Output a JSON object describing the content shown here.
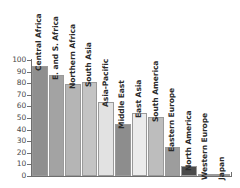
{
  "chart_data": {
    "type": "bar",
    "title": "",
    "subtitle": "",
    "xlabel": "",
    "ylabel": "",
    "ylim": [
      0,
      100
    ],
    "yticks": [
      0,
      10,
      20,
      30,
      40,
      50,
      60,
      70,
      80,
      90,
      100
    ],
    "ytick_labels": [
      "0",
      "10",
      "20",
      "30",
      "40",
      "50",
      "60",
      "70",
      "80",
      "90",
      "100"
    ],
    "grid": false,
    "legend": "none",
    "orientation": "vertical",
    "label_rotation": 90,
    "categories": [
      "Central Africa",
      "E. and S. Africa",
      "Northern Africa",
      "South Asia",
      "Asia-Pacific",
      "Middle East",
      "East Asia",
      "South America",
      "Eastern Europe",
      "North America",
      "Western Europe",
      "Japan"
    ],
    "values": [
      95,
      87,
      79,
      81,
      64,
      45,
      54,
      51,
      25,
      9,
      1,
      0
    ],
    "bar_colors": [
      "#8f8f8f",
      "#a3a3a3",
      "#b5b5b5",
      "#c4c4c4",
      "#e2e2e2",
      "#8d8d8d",
      "#ececec",
      "#bdbdbd",
      "#9d9d9d",
      "#4b4b4b",
      "#d8d8d8",
      "#efefef"
    ]
  },
  "axis": {
    "line_color": "#6e6e6e",
    "tick_label_color": "#4a4a4a"
  }
}
